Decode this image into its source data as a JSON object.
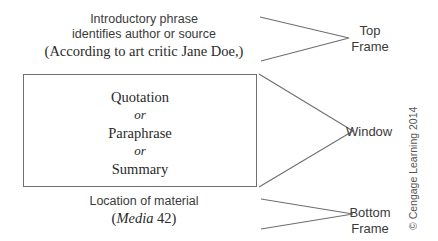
{
  "top_frame": {
    "line1": "Introductory phrase",
    "line2": "identifies author or source",
    "example": "(According to art critic Jane Doe,)",
    "label_line1": "Top",
    "label_line2": "Frame"
  },
  "window": {
    "items": [
      "Quotation",
      "or",
      "Paraphrase",
      "or",
      "Summary"
    ],
    "label": "Window"
  },
  "bottom_frame": {
    "line1": "Location of material",
    "example_open": "(",
    "example_italic": "Media",
    "example_rest": " 42)",
    "label_line1": "Bottom",
    "label_line2": "Frame"
  },
  "copyright": "© Cengage Learning 2014",
  "colors": {
    "line": "#6e6e6e",
    "text": "#333333",
    "background": "#ffffff"
  }
}
